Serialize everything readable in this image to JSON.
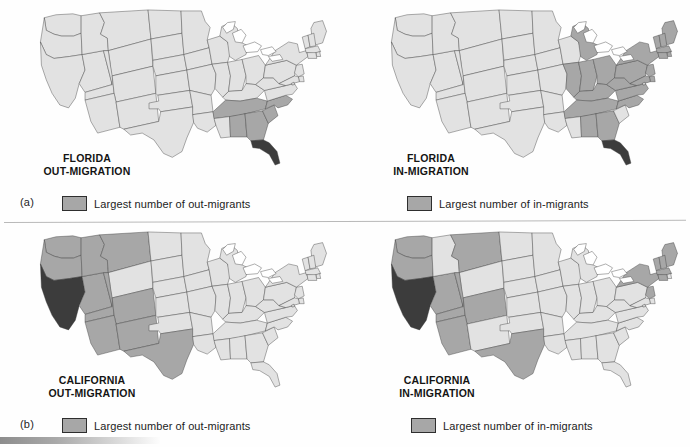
{
  "figure": {
    "scan_remnant_text": "",
    "parts": [
      {
        "key": "a",
        "label": "(a)"
      },
      {
        "key": "b",
        "label": "(b)"
      }
    ]
  },
  "colors": {
    "light_state": "#e2e2e2",
    "highlight_state": "#a7a7a7",
    "focus_state": "#3c3c3c",
    "border": "#3a3a3a",
    "lake": "#ffffff",
    "text": "#141414"
  },
  "maps": [
    {
      "id": "florida-out-migration",
      "part": "a",
      "title_line1": "FLORIDA",
      "title_line2": "OUT-MIGRATION",
      "legend_label": "Largest number of out-migrants",
      "legend_swatch_color": "#a7a7a7",
      "focus_state": "FL",
      "highlighted_states": [
        "TN",
        "AL",
        "GA",
        "SC",
        "NC"
      ]
    },
    {
      "id": "florida-in-migration",
      "part": "a",
      "title_line1": "FLORIDA",
      "title_line2": "IN-MIGRATION",
      "legend_label": "Largest number of in-migrants",
      "legend_swatch_color": "#a7a7a7",
      "focus_state": "FL",
      "highlighted_states": [
        "MI",
        "IL",
        "IN",
        "OH",
        "KY",
        "TN",
        "AL",
        "GA",
        "PA",
        "NY",
        "NJ",
        "MD",
        "DE",
        "CT",
        "RI",
        "MA",
        "VT",
        "NH",
        "ME",
        "WV",
        "VA",
        "NC"
      ]
    },
    {
      "id": "california-out-migration",
      "part": "b",
      "title_line1": "CALIFORNIA",
      "title_line2": "OUT-MIGRATION",
      "legend_label": "Largest number of out-migrants",
      "legend_swatch_color": "#a7a7a7",
      "focus_state": "CA",
      "highlighted_states": [
        "WA",
        "OR",
        "NV",
        "ID",
        "MT",
        "UT",
        "AZ",
        "NM",
        "CO",
        "TX"
      ]
    },
    {
      "id": "california-in-migration",
      "part": "b",
      "title_line1": "CALIFORNIA",
      "title_line2": "IN-MIGRATION",
      "legend_label": "Largest number of in-migrants",
      "legend_swatch_color": "#a7a7a7",
      "focus_state": "CA",
      "highlighted_states": [
        "WA",
        "OR",
        "NV",
        "MT",
        "UT",
        "CO",
        "AZ",
        "TX",
        "NY",
        "VT",
        "NH",
        "ME",
        "MA",
        "CT",
        "NJ"
      ]
    }
  ],
  "chart_data": {
    "type": "map",
    "legend_position": "below-map",
    "classes": [
      {
        "name": "Largest number of out-migrants",
        "color": "#a7a7a7"
      },
      {
        "name": "Largest number of in-migrants",
        "color": "#a7a7a7"
      },
      {
        "name": "Focus state",
        "color": "#3c3c3c"
      },
      {
        "name": "Other states",
        "color": "#e2e2e2"
      }
    ],
    "panels": [
      {
        "panel": "a",
        "maps": [
          {
            "title": "FLORIDA OUT-MIGRATION",
            "focus": "FL",
            "shaded": [
              "TN",
              "AL",
              "GA",
              "SC",
              "NC"
            ]
          },
          {
            "title": "FLORIDA IN-MIGRATION",
            "focus": "FL",
            "shaded": [
              "MI",
              "IL",
              "IN",
              "OH",
              "KY",
              "TN",
              "AL",
              "GA",
              "PA",
              "NY",
              "NJ",
              "MD",
              "DE",
              "CT",
              "RI",
              "MA",
              "VT",
              "NH",
              "ME",
              "WV",
              "VA",
              "NC"
            ]
          }
        ]
      },
      {
        "panel": "b",
        "maps": [
          {
            "title": "CALIFORNIA OUT-MIGRATION",
            "focus": "CA",
            "shaded": [
              "WA",
              "OR",
              "NV",
              "ID",
              "MT",
              "UT",
              "AZ",
              "NM",
              "CO",
              "TX"
            ]
          },
          {
            "title": "CALIFORNIA IN-MIGRATION",
            "focus": "CA",
            "shaded": [
              "WA",
              "OR",
              "NV",
              "MT",
              "UT",
              "CO",
              "AZ",
              "TX",
              "NY",
              "VT",
              "NH",
              "ME",
              "MA",
              "CT",
              "NJ"
            ]
          }
        ]
      }
    ]
  }
}
